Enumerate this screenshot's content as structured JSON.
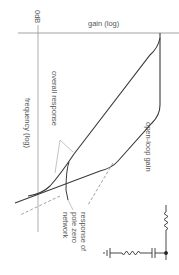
{
  "diagram": {
    "type": "bode-plot-rotated",
    "labels": {
      "zero_db": "0dB",
      "gain_axis": "gain (log)",
      "frequency_axis": "frequency (log)",
      "overall_response": "overall response",
      "open_loop_gain": "open-loop gain",
      "pole_zero_response_line1": "response of",
      "pole_zero_response_line2": "pole zero",
      "pole_zero_response_line3": "network"
    },
    "colors": {
      "curve": "#3a3a3a",
      "axis": "#8a8a8a",
      "dashed": "#8a8a8a",
      "text": "#555555"
    },
    "circuit": {
      "components": [
        "resistor",
        "junction",
        "capacitor",
        "resistor",
        "ground"
      ]
    }
  }
}
